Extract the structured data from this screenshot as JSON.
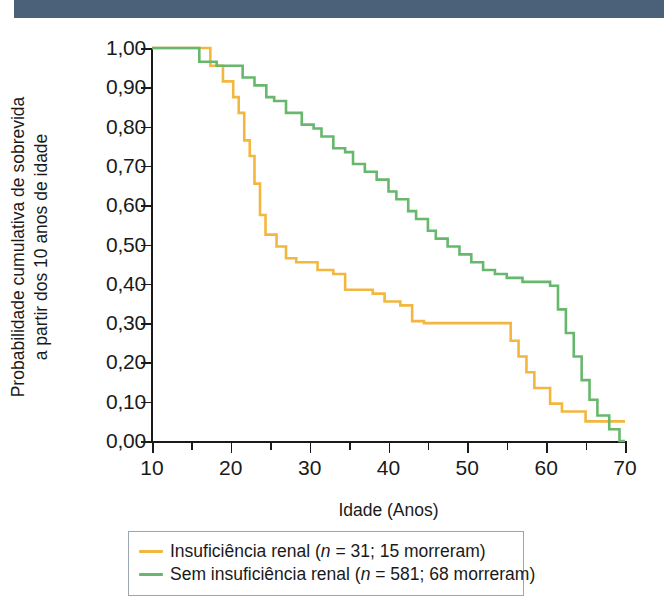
{
  "top_bar": {
    "color": "#4a6179"
  },
  "chart_data": {
    "type": "line",
    "subtype": "kaplan-meier-step",
    "title": "",
    "xlabel": "Idade (Anos)",
    "ylabel_lines": [
      "Probabilidade cumulativa de sobrevida",
      "a partir dos 10 anos de idade"
    ],
    "ylabel": "Probabilidade cumulativa de sobrevida a partir dos 10 anos de idade",
    "xlim": [
      10,
      70
    ],
    "ylim": [
      0.0,
      1.0
    ],
    "grid": false,
    "legend_position": "below-plot",
    "xticks": [
      10,
      15,
      20,
      25,
      30,
      35,
      40,
      45,
      50,
      55,
      60,
      65,
      70
    ],
    "xticklabels": [
      "10",
      "",
      "20",
      "",
      "30",
      "",
      "40",
      "",
      "50",
      "",
      "60",
      "",
      "70"
    ],
    "yticks": [
      0.0,
      0.1,
      0.2,
      0.3,
      0.4,
      0.5,
      0.6,
      0.7,
      0.8,
      0.9,
      1.0
    ],
    "yticklabels": [
      "0,00",
      "0,10",
      "0,20",
      "0,30",
      "0,40",
      "0,50",
      "0,60",
      "0,70",
      "0,80",
      "0,90",
      "1,00"
    ],
    "series": [
      {
        "name": "Insuficiência renal (n = 31; 15 morreram)",
        "label_plain": "Insuficiência renal",
        "n": 31,
        "deaths": 15,
        "color": "#f3b63f",
        "points": [
          [
            10.0,
            1.0
          ],
          [
            17.4,
            1.0
          ],
          [
            17.4,
            0.955
          ],
          [
            19.0,
            0.955
          ],
          [
            19.0,
            0.915
          ],
          [
            20.3,
            0.915
          ],
          [
            20.3,
            0.875
          ],
          [
            21.0,
            0.875
          ],
          [
            21.0,
            0.835
          ],
          [
            21.7,
            0.835
          ],
          [
            21.7,
            0.765
          ],
          [
            22.4,
            0.765
          ],
          [
            22.4,
            0.725
          ],
          [
            23.0,
            0.725
          ],
          [
            23.0,
            0.655
          ],
          [
            23.7,
            0.655
          ],
          [
            23.7,
            0.575
          ],
          [
            24.4,
            0.575
          ],
          [
            24.4,
            0.525
          ],
          [
            25.8,
            0.525
          ],
          [
            25.8,
            0.495
          ],
          [
            27.0,
            0.495
          ],
          [
            27.0,
            0.465
          ],
          [
            28.3,
            0.465
          ],
          [
            28.3,
            0.455
          ],
          [
            31.0,
            0.455
          ],
          [
            31.0,
            0.435
          ],
          [
            33.0,
            0.435
          ],
          [
            33.0,
            0.425
          ],
          [
            34.5,
            0.425
          ],
          [
            34.5,
            0.385
          ],
          [
            38.0,
            0.385
          ],
          [
            38.0,
            0.375
          ],
          [
            39.5,
            0.375
          ],
          [
            39.5,
            0.355
          ],
          [
            41.5,
            0.355
          ],
          [
            41.5,
            0.345
          ],
          [
            43.0,
            0.345
          ],
          [
            43.0,
            0.305
          ],
          [
            44.5,
            0.305
          ],
          [
            44.5,
            0.3
          ],
          [
            55.5,
            0.3
          ],
          [
            55.5,
            0.255
          ],
          [
            56.5,
            0.255
          ],
          [
            56.5,
            0.215
          ],
          [
            57.5,
            0.215
          ],
          [
            57.5,
            0.175
          ],
          [
            58.5,
            0.175
          ],
          [
            58.5,
            0.135
          ],
          [
            60.5,
            0.135
          ],
          [
            60.5,
            0.095
          ],
          [
            62.0,
            0.095
          ],
          [
            62.0,
            0.075
          ],
          [
            65.0,
            0.075
          ],
          [
            65.0,
            0.05
          ],
          [
            70.0,
            0.05
          ]
        ]
      },
      {
        "name": "Sem insuficiência renal (n = 581; 68 morreram)",
        "label_plain": "Sem insuficiência renal",
        "n": 581,
        "deaths": 68,
        "color": "#67b86c",
        "points": [
          [
            10.0,
            1.0
          ],
          [
            16.0,
            1.0
          ],
          [
            16.0,
            0.965
          ],
          [
            18.2,
            0.965
          ],
          [
            18.2,
            0.955
          ],
          [
            21.5,
            0.955
          ],
          [
            21.5,
            0.925
          ],
          [
            23.0,
            0.925
          ],
          [
            23.0,
            0.905
          ],
          [
            24.5,
            0.905
          ],
          [
            24.5,
            0.875
          ],
          [
            25.5,
            0.875
          ],
          [
            25.5,
            0.865
          ],
          [
            27.0,
            0.865
          ],
          [
            27.0,
            0.835
          ],
          [
            29.0,
            0.835
          ],
          [
            29.0,
            0.805
          ],
          [
            30.5,
            0.805
          ],
          [
            30.5,
            0.795
          ],
          [
            31.5,
            0.795
          ],
          [
            31.5,
            0.775
          ],
          [
            33.0,
            0.775
          ],
          [
            33.0,
            0.745
          ],
          [
            34.5,
            0.745
          ],
          [
            34.5,
            0.735
          ],
          [
            35.5,
            0.735
          ],
          [
            35.5,
            0.705
          ],
          [
            37.0,
            0.705
          ],
          [
            37.0,
            0.685
          ],
          [
            38.5,
            0.685
          ],
          [
            38.5,
            0.665
          ],
          [
            40.0,
            0.665
          ],
          [
            40.0,
            0.635
          ],
          [
            41.0,
            0.635
          ],
          [
            41.0,
            0.615
          ],
          [
            42.5,
            0.615
          ],
          [
            42.5,
            0.585
          ],
          [
            43.5,
            0.585
          ],
          [
            43.5,
            0.565
          ],
          [
            45.0,
            0.565
          ],
          [
            45.0,
            0.535
          ],
          [
            46.0,
            0.535
          ],
          [
            46.0,
            0.515
          ],
          [
            47.5,
            0.515
          ],
          [
            47.5,
            0.495
          ],
          [
            49.0,
            0.495
          ],
          [
            49.0,
            0.475
          ],
          [
            50.5,
            0.475
          ],
          [
            50.5,
            0.455
          ],
          [
            52.0,
            0.455
          ],
          [
            52.0,
            0.435
          ],
          [
            53.5,
            0.435
          ],
          [
            53.5,
            0.425
          ],
          [
            55.0,
            0.425
          ],
          [
            55.0,
            0.415
          ],
          [
            57.0,
            0.415
          ],
          [
            57.0,
            0.405
          ],
          [
            60.5,
            0.405
          ],
          [
            60.5,
            0.395
          ],
          [
            61.5,
            0.395
          ],
          [
            61.5,
            0.335
          ],
          [
            62.5,
            0.335
          ],
          [
            62.5,
            0.275
          ],
          [
            63.5,
            0.275
          ],
          [
            63.5,
            0.215
          ],
          [
            64.5,
            0.215
          ],
          [
            64.5,
            0.155
          ],
          [
            65.5,
            0.155
          ],
          [
            65.5,
            0.105
          ],
          [
            66.5,
            0.105
          ],
          [
            66.5,
            0.065
          ],
          [
            68.0,
            0.065
          ],
          [
            68.0,
            0.03
          ],
          [
            69.3,
            0.03
          ],
          [
            69.3,
            0.0
          ],
          [
            70.0,
            0.0
          ]
        ]
      }
    ]
  },
  "legend": {
    "items": [
      {
        "color": "#f3b63f",
        "pre": "Insuficiência renal (",
        "n_italic": "n",
        "post": " = 31; 15 morreram)"
      },
      {
        "color": "#67b86c",
        "pre": "Sem insuficiência renal (",
        "n_italic": "n",
        "post": " = 581; 68 morreram)"
      }
    ]
  }
}
